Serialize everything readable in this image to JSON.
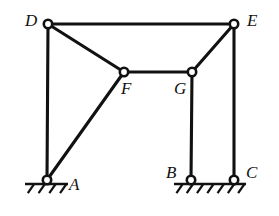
{
  "figure": {
    "type": "truss-diagram",
    "width": 279,
    "height": 216,
    "background_color": "#ffffff",
    "line_color": "#111111",
    "joint_fill_color": "#ffffff"
  },
  "joints": [
    {
      "id": "A",
      "label": "A",
      "x": 47,
      "y": 180,
      "support": "pin",
      "label_x": 69,
      "label_y": 176
    },
    {
      "id": "B",
      "label": "B",
      "x": 191,
      "y": 180,
      "support": "pin",
      "label_x": 166,
      "label_y": 164
    },
    {
      "id": "C",
      "label": "C",
      "x": 234,
      "y": 180,
      "support": "pin",
      "label_x": 246,
      "label_y": 164
    },
    {
      "id": "D",
      "label": "D",
      "x": 48,
      "y": 24,
      "support": "free",
      "label_x": 25,
      "label_y": 12
    },
    {
      "id": "E",
      "label": "E",
      "x": 234,
      "y": 24,
      "support": "free",
      "label_x": 247,
      "label_y": 12
    },
    {
      "id": "F",
      "label": "F",
      "x": 124,
      "y": 72,
      "support": "free",
      "label_x": 121,
      "label_y": 80
    },
    {
      "id": "G",
      "label": "G",
      "x": 192,
      "y": 72,
      "support": "free",
      "label_x": 174,
      "label_y": 80
    }
  ],
  "members": [
    {
      "id": "DE",
      "from": "D",
      "to": "E",
      "x1": 48,
      "y1": 24,
      "x2": 234,
      "y2": 24
    },
    {
      "id": "DA",
      "from": "D",
      "to": "A",
      "x1": 48,
      "y1": 24,
      "x2": 47,
      "y2": 180
    },
    {
      "id": "DF",
      "from": "D",
      "to": "F",
      "x1": 48,
      "y1": 24,
      "x2": 124,
      "y2": 72
    },
    {
      "id": "FG",
      "from": "F",
      "to": "G",
      "x1": 124,
      "y1": 72,
      "x2": 192,
      "y2": 72
    },
    {
      "id": "FA",
      "from": "F",
      "to": "A",
      "x1": 124,
      "y1": 72,
      "x2": 47,
      "y2": 180
    },
    {
      "id": "GE",
      "from": "G",
      "to": "E",
      "x1": 192,
      "y1": 72,
      "x2": 234,
      "y2": 24
    },
    {
      "id": "GB",
      "from": "G",
      "to": "B",
      "x1": 192,
      "y1": 72,
      "x2": 191,
      "y2": 180
    },
    {
      "id": "EC",
      "from": "E",
      "to": "C",
      "x1": 234,
      "y1": 24,
      "x2": 234,
      "y2": 180
    }
  ],
  "supports": [
    {
      "id": "ground-left",
      "serves": "A",
      "line_x1": 25,
      "line_x2": 68,
      "line_y": 184,
      "hatch_count": 4,
      "hatch_length": 11,
      "hatch_angle_deg": 55
    },
    {
      "id": "ground-right",
      "serves": "B and C",
      "line_x1": 174,
      "line_x2": 246,
      "line_y": 184,
      "hatch_count": 7,
      "hatch_length": 11,
      "hatch_angle_deg": 55
    }
  ],
  "joint_radius": 4.2
}
